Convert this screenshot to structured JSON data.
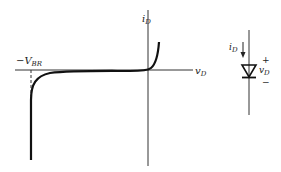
{
  "graph": {
    "y_axis_label": "i",
    "y_axis_sub": "D",
    "x_axis_label": "v",
    "x_axis_sub": "D",
    "breakdown_label_prefix": "−V",
    "breakdown_label_sub": "BR"
  },
  "diode": {
    "current_label": "i",
    "current_sub": "D",
    "voltage_label": "v",
    "voltage_sub": "D",
    "plus": "+",
    "minus": "−"
  },
  "colors": {
    "line": "#222222",
    "curve": "#111111",
    "background": "#ffffff"
  }
}
